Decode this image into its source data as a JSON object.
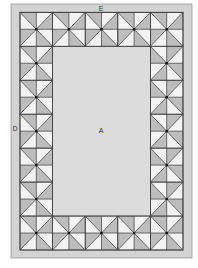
{
  "diagram": {
    "labels": {
      "center": "A",
      "side_border": "D",
      "top_bottom_border": "E"
    },
    "grid": {
      "columns": 10,
      "rows": 14,
      "border_cells": 2,
      "block_size_cells": 2
    },
    "block_pattern": "pinwheel-hourglass",
    "colors": {
      "outer_band": "#d3d3d3",
      "center_panel": "#dcdcdc",
      "dark_triangle": "#bdbdbd",
      "light_triangle": "#f3f3f3",
      "line": "#3a3a3a",
      "dot": "#111111",
      "frame_line": "#9a9a9a"
    }
  }
}
